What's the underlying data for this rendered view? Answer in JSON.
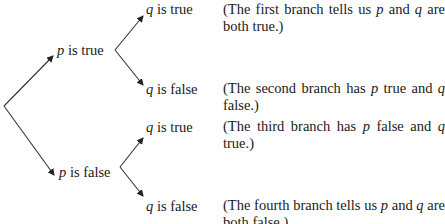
{
  "diagram": {
    "type": "tree-diagram",
    "root": {
      "branches": [
        {
          "var": "p",
          "label": " is true",
          "children": [
            {
              "var": "q",
              "label": " is true"
            },
            {
              "var": "q",
              "label": " is false"
            }
          ]
        },
        {
          "var": "p",
          "label": " is false",
          "children": [
            {
              "var": "q",
              "label": " is true"
            },
            {
              "var": "q",
              "label": " is false"
            }
          ]
        }
      ]
    },
    "notes": [
      {
        "pre": "(The first branch tells us ",
        "v1": "p",
        "mid": " and ",
        "v2": "q",
        "post": " are both true.)"
      },
      {
        "pre": "(The second branch has ",
        "v1": "p",
        "mid": " true and ",
        "v2": "q",
        "post": " false.)"
      },
      {
        "pre": "(The third branch has ",
        "v1": "p",
        "mid": " false and ",
        "v2": "q",
        "post": " true.)"
      },
      {
        "pre": "(The fourth branch tells us ",
        "v1": "p",
        "mid": " and ",
        "v2": "q",
        "post": " are both false.)"
      }
    ],
    "line_color": "#333333"
  }
}
